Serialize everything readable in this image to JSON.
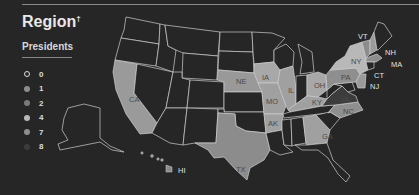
{
  "header": {
    "title": "Region",
    "title_mark": "†",
    "subtitle": "Presidents"
  },
  "legend": {
    "items": [
      {
        "label": "0",
        "color": "#262626",
        "outline": true
      },
      {
        "label": "1",
        "color": "#8c8c8c"
      },
      {
        "label": "2",
        "color": "#7a7a7a"
      },
      {
        "label": "4",
        "color": "#b8b8b8"
      },
      {
        "label": "7",
        "color": "#8f8f8f"
      },
      {
        "label": "8",
        "color": "#3c3c3c"
      }
    ]
  },
  "map": {
    "state_labels": {
      "CA": "CA",
      "TX": "TX",
      "NE": "NE",
      "IA": "IA",
      "MO": "MO",
      "IL": "IL",
      "AK": "AK",
      "OH": "OH",
      "KY": "KY",
      "PA": "PA",
      "NY": "NY",
      "VT": "VT",
      "NH": "NH",
      "MA": "MA",
      "CT": "CT",
      "NJ": "NJ",
      "VA": "VA",
      "NC": "NC",
      "GA": "GA",
      "HI": "HI"
    },
    "colors": {
      "zero": "#262626",
      "one": "#8c8c8c",
      "two": "#7a7a7a",
      "four": "#b8b8b8",
      "seven": "#8f8f8f",
      "eight": "#3c3c3c",
      "border": "#cfcfcf"
    }
  }
}
